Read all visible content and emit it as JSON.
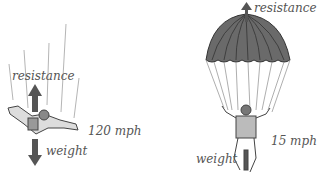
{
  "freefall": {
    "resistance_label": "resistance",
    "weight_label": "weight",
    "speed_label": "120 mph"
  },
  "parachute": {
    "resistance_label": "resistance",
    "weight_label": "weight",
    "speed_label": "15 mph"
  },
  "colors": {
    "arrow": "#555555",
    "canopy": "#666666",
    "text": "#555555",
    "lines": "#aaaaaa"
  }
}
